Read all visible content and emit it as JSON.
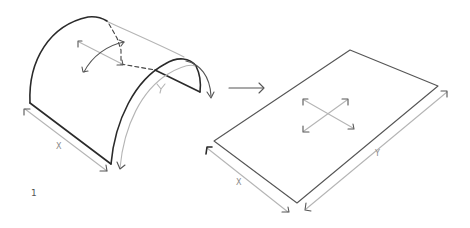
{
  "figure": {
    "number": "1",
    "curved_shell": {
      "x_label": "X",
      "y_label": "Y"
    },
    "transform_arrow": "right-arrow",
    "flat_plate": {
      "x_label": "X",
      "y_label": "Y"
    }
  }
}
